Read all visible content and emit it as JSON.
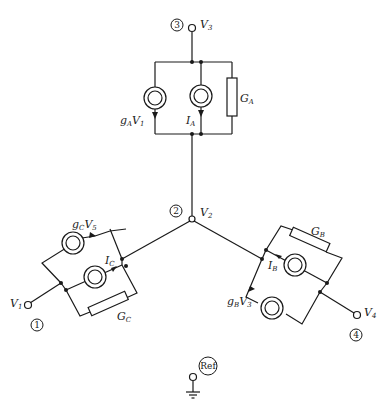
{
  "diagram": {
    "type": "circuit-schematic",
    "nodes": [
      {
        "id": "1",
        "number_label": "1",
        "voltage_main": "V",
        "voltage_sub": "1"
      },
      {
        "id": "2",
        "number_label": "2",
        "voltage_main": "V",
        "voltage_sub": "2"
      },
      {
        "id": "3",
        "number_label": "3",
        "voltage_main": "V",
        "voltage_sub": "3"
      },
      {
        "id": "4",
        "number_label": "4",
        "voltage_main": "V",
        "voltage_sub": "4"
      },
      {
        "id": "ref",
        "number_label": "Ref"
      }
    ],
    "branches": {
      "A": {
        "between": "3-2",
        "controlled_source": {
          "main": "g",
          "sub": "A",
          "main2": "V",
          "sub2": "1"
        },
        "independent_source": {
          "main": "I",
          "sub": "A"
        },
        "conductance": {
          "main": "G",
          "sub": "A"
        }
      },
      "B": {
        "between": "2-4",
        "controlled_source": {
          "main": "g",
          "sub": "B",
          "main2": "V",
          "sub2": "3"
        },
        "independent_source": {
          "main": "I",
          "sub": "B"
        },
        "conductance": {
          "main": "G",
          "sub": "B"
        }
      },
      "C": {
        "between": "1-2",
        "controlled_source": {
          "main": "g",
          "sub": "C",
          "main2": "V",
          "sub2": "5"
        },
        "independent_source": {
          "main": "I",
          "sub": "C"
        },
        "conductance": {
          "main": "G",
          "sub": "C"
        }
      }
    }
  }
}
